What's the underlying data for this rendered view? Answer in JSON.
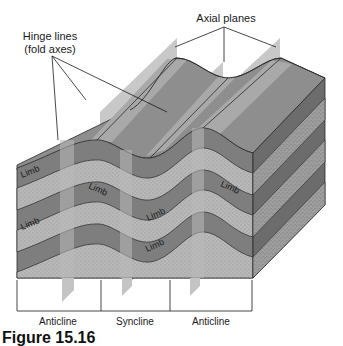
{
  "figure": {
    "callouts": {
      "axial_planes": "Axial planes",
      "hinge_lines_line1": "Hinge lines",
      "hinge_lines_line2": "(fold axes)"
    },
    "limb_labels": [
      "Limb",
      "Limb",
      "Limb",
      "Limb",
      "Limb",
      "Limb"
    ],
    "fold_labels": [
      "Anticline",
      "Syncline",
      "Anticline"
    ],
    "caption": "Figure 15.16",
    "colors": {
      "top_surface": "#8f8f8f",
      "top_surface_light": "#a9a9a9",
      "axial_plane": "#c4c4c4",
      "layer_dark": "#7d7d7d",
      "layer_stippled": "#b3b3b3",
      "side_dark": "#6a6a6a",
      "side_stippled": "#9a9a9a",
      "outline": "#2a2a2a"
    }
  }
}
